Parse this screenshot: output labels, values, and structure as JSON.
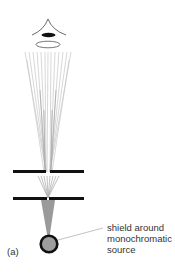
{
  "diagram": {
    "panel_label": "(a)",
    "source_label": {
      "lines": [
        "shield around",
        "monochromatic",
        "source"
      ]
    },
    "components": [
      {
        "name": "eye",
        "icon": "eye-icon"
      },
      {
        "name": "lens",
        "icon": "lens-icon"
      },
      {
        "name": "light-rays",
        "icon": "rays-icon"
      },
      {
        "name": "upper-slit-barrier"
      },
      {
        "name": "lower-slit-barrier"
      },
      {
        "name": "monochromatic-light-source",
        "icon": "light-source-icon"
      }
    ],
    "colors": {
      "barrier": "#111111",
      "cone": "#9a9a9a",
      "source_fill": "#9e9e9e",
      "source_stroke": "#111111",
      "rays": "#b8b8b8",
      "leader_line": "#999999",
      "text": "#333333"
    }
  }
}
